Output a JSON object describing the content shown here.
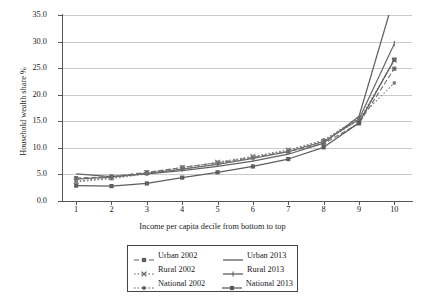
{
  "chart_data": {
    "type": "line",
    "title": "",
    "xlabel": "Income per capita decile from bottom to top",
    "ylabel": "Household wealth share %",
    "x": [
      1,
      2,
      3,
      4,
      5,
      6,
      7,
      8,
      9,
      10
    ],
    "xtick_labels": [
      "1",
      "2",
      "3",
      "4",
      "5",
      "6",
      "7",
      "8",
      "9",
      "10"
    ],
    "ytick_labels": [
      "0.0",
      "5.0",
      "10.0",
      "15.0",
      "20.0",
      "25.0",
      "30.0",
      "35.0"
    ],
    "yticks": [
      0.0,
      5.0,
      10.0,
      15.0,
      20.0,
      25.0,
      30.0,
      35.0
    ],
    "ylim": [
      0.0,
      35.0
    ],
    "xlim": [
      0.6,
      10.5
    ],
    "grid": "horizontal",
    "legend_position": "below-center",
    "series": [
      {
        "name": "Urban 2002",
        "style": "dashed",
        "marker": "square",
        "color": "#6d6d6d",
        "values": [
          4.3,
          4.6,
          5.4,
          6.3,
          7.2,
          8.2,
          9.3,
          10.8,
          14.6,
          24.9
        ]
      },
      {
        "name": "Rural 2002",
        "style": "dotted",
        "marker": "cross",
        "color": "#7a7a7a",
        "values": [
          3.7,
          4.4,
          5.3,
          6.3,
          7.3,
          8.4,
          9.6,
          11.2,
          15.2,
          26.5
        ]
      },
      {
        "name": "National 2002",
        "style": "dotted",
        "marker": "dot",
        "color": "#808080",
        "values": [
          3.6,
          4.2,
          5.1,
          6.0,
          7.0,
          8.2,
          9.6,
          11.5,
          15.6,
          22.2
        ]
      },
      {
        "name": "Urban 2013",
        "style": "solid",
        "marker": "none",
        "color": "#636363",
        "values": [
          5.1,
          4.6,
          5.1,
          5.7,
          6.5,
          7.5,
          8.8,
          10.9,
          15.9,
          38.5
        ]
      },
      {
        "name": "Rural 2013",
        "style": "solid",
        "marker": "tick",
        "color": "#6b6b6b",
        "values": [
          4.1,
          4.5,
          5.2,
          6.0,
          6.9,
          8.0,
          9.3,
          11.2,
          15.4,
          29.6
        ]
      },
      {
        "name": "National 2013",
        "style": "solid",
        "marker": "square",
        "color": "#5e5e5e",
        "values": [
          2.9,
          2.8,
          3.3,
          4.4,
          5.4,
          6.5,
          7.9,
          10.1,
          14.7,
          26.6
        ]
      }
    ]
  },
  "legend": {
    "rows": [
      [
        {
          "label": "Urban 2002",
          "key": "dashed-square-key"
        },
        {
          "label": "Urban 2013",
          "key": "solid-line-key"
        }
      ],
      [
        {
          "label": "Rural 2002",
          "key": "dotted-cross-key"
        },
        {
          "label": "Rural 2013",
          "key": "solid-tick-key"
        }
      ],
      [
        {
          "label": "National 2002",
          "key": "dotted-dot-key"
        },
        {
          "label": "National 2013",
          "key": "solid-square-key"
        }
      ]
    ]
  }
}
